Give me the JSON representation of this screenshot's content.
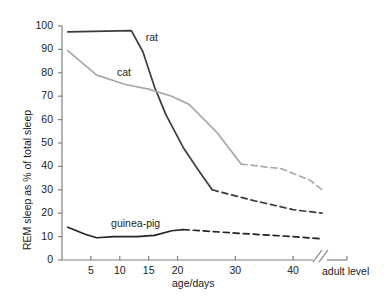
{
  "chart_data": {
    "type": "line",
    "title": "",
    "xlabel": "age/days",
    "ylabel": "REM sleep as % of total sleep",
    "xlim": [
      0,
      46
    ],
    "ylim": [
      0,
      100
    ],
    "grid": false,
    "legend_position": "inline-labels",
    "x_tick_labels": [
      "5",
      "10",
      "15",
      "20",
      "30",
      "40"
    ],
    "x_tick_values": [
      5,
      10,
      15,
      20,
      30,
      40
    ],
    "y_tick_labels": [
      "0",
      "10",
      "20",
      "30",
      "40",
      "50",
      "60",
      "70",
      "80",
      "90",
      "100"
    ],
    "y_tick_values": [
      0,
      10,
      20,
      30,
      40,
      50,
      60,
      70,
      80,
      90,
      100
    ],
    "axis_break": {
      "present": true,
      "label": "adult level",
      "position_days": 43.5
    },
    "annotations": [
      {
        "text": "rat",
        "x": 14.5,
        "y": 95
      },
      {
        "text": "cat",
        "x": 9.5,
        "y": 80
      },
      {
        "text": "guinea-pig",
        "x": 8.5,
        "y": 15.5
      }
    ],
    "series": [
      {
        "name": "rat",
        "color": "#3c3c3c",
        "solid": {
          "x": [
            1,
            12,
            14,
            16,
            18,
            21,
            24,
            26
          ],
          "y": [
            97.5,
            98,
            89,
            74,
            62,
            48,
            37,
            30
          ]
        },
        "dashed": {
          "x": [
            26,
            33,
            40,
            45
          ],
          "y": [
            30,
            25.5,
            21.5,
            20
          ]
        }
      },
      {
        "name": "cat",
        "color": "#a8a8a8",
        "solid": {
          "x": [
            1,
            6,
            11,
            15,
            19,
            22,
            27,
            31
          ],
          "y": [
            89.5,
            79,
            75,
            73,
            70,
            66.5,
            54,
            41
          ]
        },
        "dashed": {
          "x": [
            31,
            38,
            43,
            45
          ],
          "y": [
            41,
            39,
            34,
            30
          ]
        }
      },
      {
        "name": "guinea-pig",
        "color": "#242424",
        "solid": {
          "x": [
            1,
            4,
            6,
            9,
            13,
            16,
            19,
            21
          ],
          "y": [
            14,
            11,
            9.5,
            10,
            10,
            10.5,
            12.5,
            13
          ]
        },
        "dashed": {
          "x": [
            21,
            30,
            40,
            45
          ],
          "y": [
            13,
            11.5,
            10,
            9
          ]
        }
      }
    ]
  }
}
